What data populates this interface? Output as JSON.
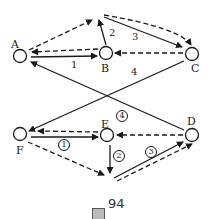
{
  "diagram": {
    "caption": "圖 94",
    "caption_glyph": "圖",
    "caption_number": "94",
    "nodes": {
      "A": {
        "label": "A"
      },
      "B": {
        "label": "B"
      },
      "C": {
        "label": "C"
      },
      "D": {
        "label": "D"
      },
      "E": {
        "label": "E"
      },
      "F": {
        "label": "F"
      }
    },
    "edge_labels": {
      "top_1": "1",
      "top_2": "2",
      "top_3": "3",
      "top_4": "4",
      "bottom_1": "1",
      "bottom_2": "2",
      "bottom_3": "3",
      "bottom_4": "4"
    },
    "colors": {
      "stroke": "#1a1a1a",
      "background": "#ffffff"
    }
  }
}
